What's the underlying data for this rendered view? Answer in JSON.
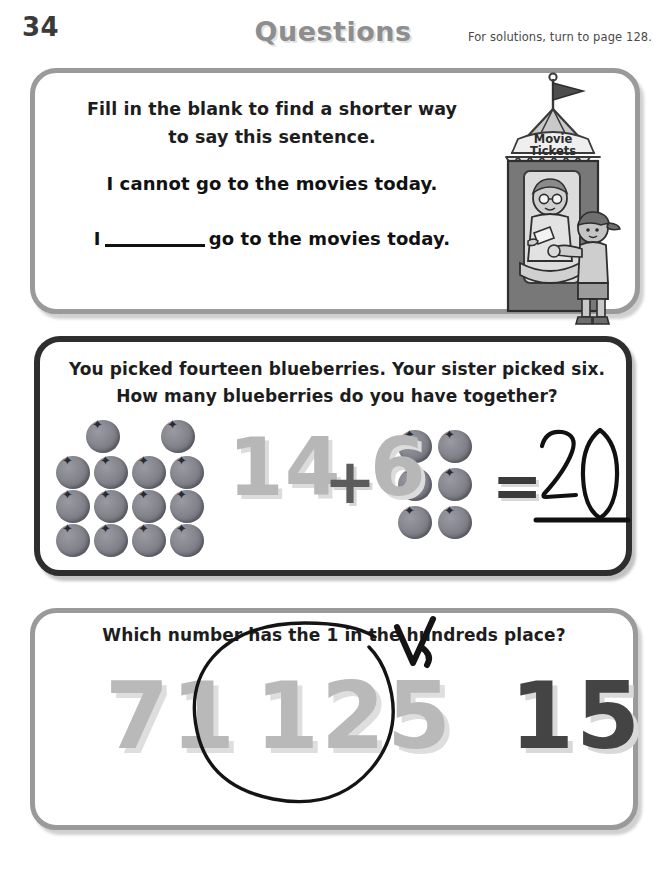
{
  "header": {
    "page_number": "34",
    "title": "Questions",
    "solutions_note": "For solutions, turn to page 128."
  },
  "questions": [
    {
      "id": "q1",
      "border_style": "light",
      "border_color": "#9a9a9a",
      "prompt": "Fill in the blank to find a shorter way to say this sentence.",
      "sentence": "I cannot go to the movies today.",
      "blank_prefix": "I",
      "blank_suffix": "go to the movies today.",
      "illustration": {
        "name": "movie-ticket-booth",
        "sign_line1": "Movie",
        "sign_line2": "Tickets"
      }
    },
    {
      "id": "q2",
      "border_style": "dark",
      "border_color": "#2e2e2e",
      "prompt": "You picked fourteen blueberries. Your sister picked six. How many blueberries do you have together?",
      "equation": {
        "left_operand": "14",
        "operator": "+",
        "right_operand": "6",
        "equals": "=",
        "handwritten_answer": "20"
      },
      "left_group_count": 14,
      "right_group_count": 6,
      "berry_color": "#6f6f79",
      "numeral_color": "#b7b7b7"
    },
    {
      "id": "q3",
      "border_style": "light",
      "border_color": "#9a9a9a",
      "prompt": "Which number has the 1 in the hundreds place?",
      "choices": [
        {
          "label": "71",
          "tone": "grey",
          "circled": false
        },
        {
          "label": "125",
          "tone": "grey",
          "circled": true
        },
        {
          "label": "15",
          "tone": "dark",
          "circled": false
        }
      ],
      "annotations": [
        "hand-drawn-circle",
        "hand-drawn-arrow"
      ]
    }
  ]
}
